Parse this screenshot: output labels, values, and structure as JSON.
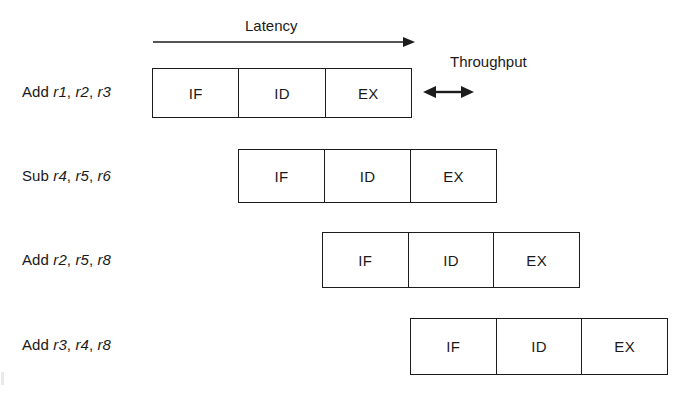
{
  "diagram": {
    "title_annotations": {
      "latency": {
        "label": "Latency",
        "arrow": "single-arrow-right",
        "arrow_x_start": 153,
        "arrow_x_end": 412,
        "arrow_y": 42,
        "text_x": 245,
        "text_y": 17
      },
      "throughput": {
        "label": "Throughput",
        "arrow": "double-arrow-horizontal",
        "arrow_x_start": 423,
        "arrow_x_end": 474,
        "arrow_y": 92,
        "text_x": 450,
        "text_y": 53
      }
    },
    "stage_names": [
      "IF",
      "ID",
      "EX"
    ],
    "rows": [
      {
        "instruction": "Add",
        "operands": [
          "r1",
          "r2",
          "r3"
        ],
        "label_full": "Add r1, r2, r3",
        "label_y": 83,
        "box_left": 152,
        "box_top": 68,
        "box_width": 260,
        "box_height": 50,
        "stages": [
          "IF",
          "ID",
          "EX"
        ]
      },
      {
        "instruction": "Sub",
        "operands": [
          "r4",
          "r5",
          "r6"
        ],
        "label_full": "Sub r4, r5, r6",
        "label_y": 167,
        "box_left": 238,
        "box_top": 149,
        "box_width": 259,
        "box_height": 54,
        "stages": [
          "IF",
          "ID",
          "EX"
        ]
      },
      {
        "instruction": "Add",
        "operands": [
          "r2",
          "r5",
          "r8"
        ],
        "label_full": "Add r2, r5, r8",
        "label_y": 251,
        "box_left": 322,
        "box_top": 232,
        "box_width": 258,
        "box_height": 56,
        "stages": [
          "IF",
          "ID",
          "EX"
        ]
      },
      {
        "instruction": "Add",
        "operands": [
          "r3",
          "r4",
          "r8"
        ],
        "label_full": "Add r3, r4, r8",
        "label_y": 336,
        "box_left": 410,
        "box_top": 318,
        "box_width": 258,
        "box_height": 57,
        "stages": [
          "IF",
          "ID",
          "EX"
        ]
      }
    ],
    "colors": {
      "background": "#ffffff",
      "stroke": "#1c1c1c",
      "text": "#1a1a1a"
    }
  }
}
